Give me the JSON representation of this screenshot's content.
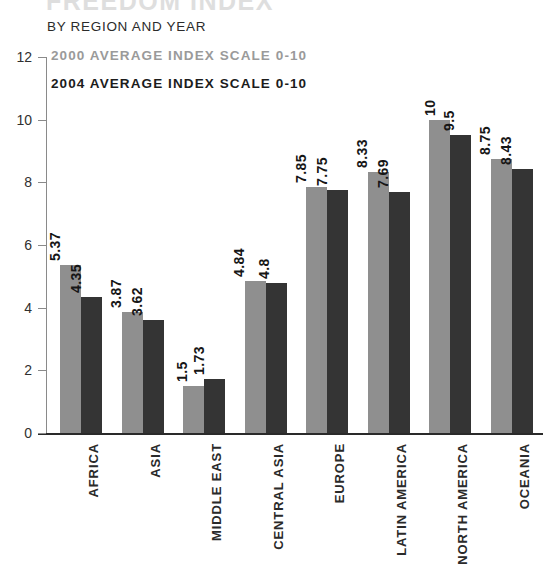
{
  "title": {
    "main": "FREEDOM INDEX",
    "sub": "BY REGION AND YEAR"
  },
  "legend": {
    "entries": [
      {
        "label": "2000 AVERAGE INDEX SCALE 0-10",
        "color": "#9a9a9a",
        "key": "2000"
      },
      {
        "label": "2004 AVERAGE INDEX SCALE 0-10",
        "color": "#1c1c1c",
        "key": "2004"
      }
    ]
  },
  "colors": {
    "series_2000_bar": "#8f8f8f",
    "series_2004_bar": "#343434",
    "legend_2000_text": "#9a9a9a",
    "legend_2004_text": "#1c1c1c",
    "axis": "#2a2a2a",
    "background": "#ffffff"
  },
  "axis": {
    "y_ticks": [
      "0",
      "2",
      "4",
      "6",
      "8",
      "10",
      "12"
    ],
    "y_tick_values": [
      0,
      2,
      4,
      6,
      8,
      10,
      12
    ]
  },
  "chart_data": {
    "type": "bar",
    "title": "FREEDOM INDEX",
    "subtitle": "BY REGION AND YEAR",
    "xlabel": "",
    "ylabel": "",
    "ylim": [
      0,
      12
    ],
    "yticks": [
      0,
      2,
      4,
      6,
      8,
      10,
      12
    ],
    "grid": false,
    "legend_position": "top-left",
    "categories": [
      "AFRICA",
      "ASIA",
      "MIDDLE EAST",
      "CENTRAL ASIA",
      "EUROPE",
      "LATIN AMERICA",
      "NORTH AMERICA",
      "OCEANIA"
    ],
    "series": [
      {
        "name": "2000 AVERAGE INDEX SCALE 0-10",
        "color": "#8f8f8f",
        "values": [
          5.37,
          3.87,
          1.5,
          4.84,
          7.85,
          8.33,
          10,
          8.75
        ],
        "labels": [
          "5.37",
          "3.87",
          "1.5",
          "4.84",
          "7.85",
          "8.33",
          "10",
          "8.75"
        ]
      },
      {
        "name": "2004 AVERAGE INDEX SCALE 0-10",
        "color": "#343434",
        "values": [
          4.35,
          3.62,
          1.73,
          4.8,
          7.75,
          7.69,
          9.5,
          8.43
        ],
        "labels": [
          "4.35",
          "3.62",
          "1.73",
          "4.8",
          "7.75",
          "7.69",
          "9.5",
          "8.43"
        ]
      }
    ]
  }
}
